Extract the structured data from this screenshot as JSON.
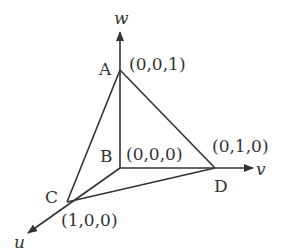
{
  "diagram": {
    "title": "",
    "axes": [
      {
        "id": "u",
        "label": "u"
      },
      {
        "id": "v",
        "label": "v"
      },
      {
        "id": "w",
        "label": "w"
      }
    ],
    "vertices": [
      {
        "id": "A",
        "label": "A",
        "coords": "(0,0,1)"
      },
      {
        "id": "B",
        "label": "B",
        "coords": "(0,0,0)"
      },
      {
        "id": "C",
        "label": "C",
        "coords": "(1,0,0)"
      },
      {
        "id": "D",
        "label": "D",
        "coords": "(0,1,0)"
      }
    ],
    "edges": [
      [
        "A",
        "B"
      ],
      [
        "A",
        "C"
      ],
      [
        "A",
        "D"
      ],
      [
        "B",
        "C"
      ],
      [
        "B",
        "D"
      ],
      [
        "C",
        "D"
      ]
    ],
    "colors": {
      "line": "#333333",
      "background": "#ffffff"
    }
  }
}
